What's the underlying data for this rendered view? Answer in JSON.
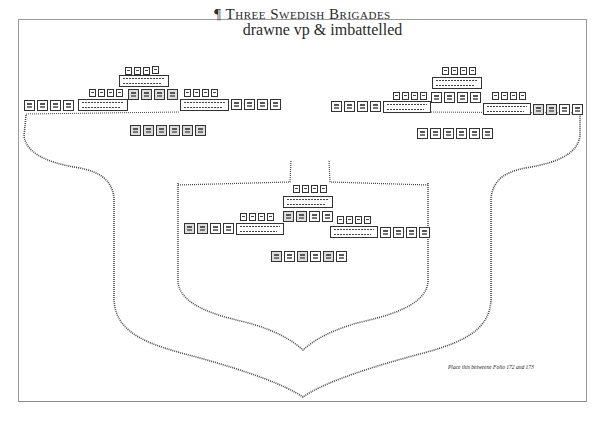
{
  "title": {
    "pilcrow": "¶",
    "line1": "Three Swedish Brigades",
    "line2": "drawne vp & imbattelled"
  },
  "caption": "Place this betweene Folio 172 and 173",
  "diagram": {
    "type": "military-formation-plan",
    "brigades": [
      {
        "name": "left-brigade",
        "position": "upper-left",
        "formation": {
          "colour_squadron_top": {
            "markers": 4,
            "block": 1
          },
          "front_row": {
            "left_wing_units": 5,
            "center_markers": 4,
            "center_block": 1,
            "right_group_units": 4
          },
          "second_line_markers": 4,
          "right_row": {
            "block": 1,
            "units": 4
          },
          "reserve_row": {
            "units": 6
          }
        }
      },
      {
        "name": "right-brigade",
        "position": "upper-right",
        "formation": {
          "colour_squadron_top": {
            "markers": 4,
            "block": 1
          },
          "front_row": {
            "left_wing_units": 4,
            "center_markers": 4,
            "center_block": 1,
            "center_units": 4
          },
          "right_row": {
            "markers": 4,
            "block": 1,
            "units": 4
          },
          "reserve_row": {
            "units": 6
          }
        }
      },
      {
        "name": "center-brigade",
        "position": "lower-center",
        "formation": {
          "colour_squadron_top": {
            "markers": 4,
            "block": 1,
            "units": 4
          },
          "left_row": {
            "units": 4,
            "markers": 4,
            "block": 1
          },
          "right_row": {
            "markers": 4,
            "block": 1,
            "units": 4
          },
          "reserve_row": {
            "units": 6
          }
        }
      }
    ],
    "outlines": [
      {
        "name": "outer-shield-outline",
        "style": "dotted"
      },
      {
        "name": "inner-shield-outline",
        "style": "dotted"
      }
    ]
  }
}
